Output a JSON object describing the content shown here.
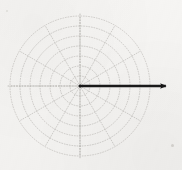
{
  "figure": {
    "background_color": "#f6f5f3",
    "width": 182,
    "height": 170
  },
  "chart_data": {
    "type": "scatter",
    "plot_kind": "polar-grid-vector",
    "title": "",
    "subtitle": "",
    "xlabel": "",
    "ylabel": "",
    "grid": true,
    "legend": null,
    "legend_position": "none",
    "annotations": [],
    "polar": {
      "center_x": 80,
      "center_y": 86,
      "radial_gridlines": {
        "count": 7,
        "radii_px": [
          10,
          20,
          30,
          40,
          50,
          60,
          70
        ],
        "r_values": [
          1,
          2,
          3,
          4,
          5,
          6,
          7
        ],
        "rmax": 7,
        "style": "dotted",
        "color": "#a8a5a0",
        "tick_labels": []
      },
      "angular_gridlines": {
        "count": 12,
        "step_degrees": 30,
        "angles_degrees": [
          0,
          30,
          60,
          90,
          120,
          150,
          180,
          210,
          240,
          270,
          300,
          330
        ],
        "style": "dotted",
        "color": "#a8a5a0",
        "tick_labels": []
      },
      "axes": {
        "horizontal_extent_px": [
          8,
          152
        ],
        "vertical_extent_px": [
          14,
          158
        ],
        "style": "dotted",
        "color": "#9b9893"
      }
    },
    "series": [
      {
        "name": "vector",
        "type": "arrow",
        "color": "#1a1a1a",
        "angle_degrees": 0,
        "magnitude_r": 9.2,
        "start_px": [
          80,
          86
        ],
        "end_px": [
          172,
          86
        ],
        "line_width_px": 2.4,
        "arrowhead": "filled-triangle"
      }
    ],
    "x": [
      0
    ],
    "values": [
      9.2
    ],
    "xlim": [
      -7,
      9.2
    ],
    "ylim": [
      -7,
      7
    ]
  },
  "marks": {
    "corner_speck_label": "paper-speck"
  }
}
